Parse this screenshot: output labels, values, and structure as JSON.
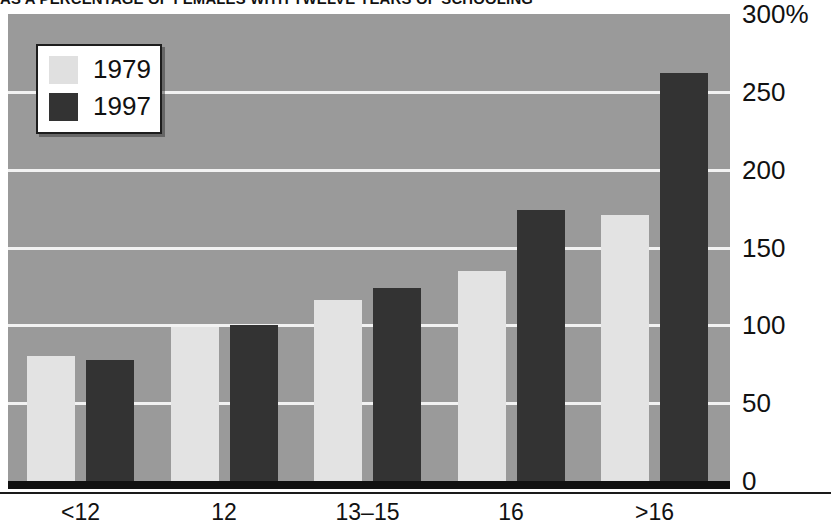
{
  "chart_data": {
    "type": "bar",
    "title": "AS A PERCENTAGE OF FEMALES WITH TWELVE YEARS OF SCHOOLING",
    "xlabel": "",
    "ylabel": "",
    "categories": [
      "<12",
      "12",
      "13–15",
      "16",
      ">16"
    ],
    "series": [
      {
        "name": "1979",
        "values": [
          80,
          99,
          116,
          135,
          171
        ]
      },
      {
        "name": "1997",
        "values": [
          78,
          100,
          124,
          174,
          262
        ]
      }
    ],
    "ylim": [
      0,
      300
    ],
    "yticks": [
      0,
      50,
      100,
      150,
      200,
      250,
      300
    ],
    "ytick_labels": [
      "0",
      "50",
      "100",
      "150",
      "200",
      "250",
      "300%"
    ],
    "grid": true,
    "legend_position": "top-left",
    "colors": {
      "series_1979": "#e3e3e3",
      "series_1997": "#333333",
      "plot_background": "#9a9a9a",
      "gridline": "#f2f2f2",
      "axis": "#111111",
      "text": "#111111"
    }
  },
  "legend": {
    "items": [
      {
        "label": "1979",
        "swatch": "light-gray"
      },
      {
        "label": "1997",
        "swatch": "dark-gray"
      }
    ]
  }
}
